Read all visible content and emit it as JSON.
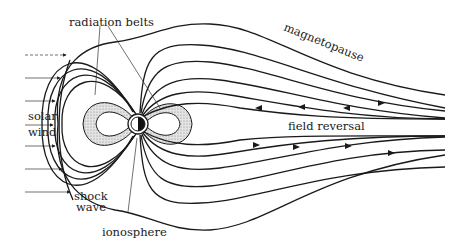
{
  "figure": {
    "labels": {
      "radiation_belts": "radiation belts",
      "magnetopause": "magnetopause",
      "solar": "solar",
      "wind": "wind",
      "field_reversal": "field reversal",
      "shock": "shock",
      "wave": "wave",
      "ionosphere": "ionosphere"
    },
    "colors": {
      "ink": "#1a1a1a",
      "belt_shading": "#cfcfcf",
      "earth_dark": "#111111"
    }
  }
}
